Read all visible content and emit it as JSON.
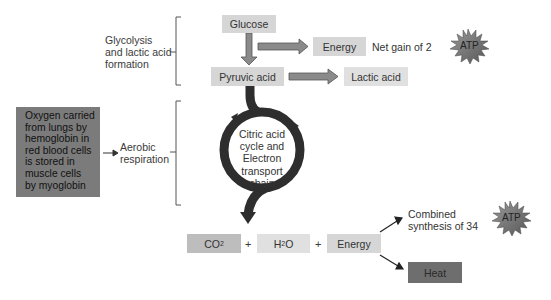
{
  "stages": {
    "glycolysis": {
      "label_lines": [
        "Glycolysis",
        "and lactic acid",
        "formation"
      ]
    },
    "aerobic": {
      "label_lines": [
        "Aerobic",
        "respiration"
      ]
    }
  },
  "boxes": {
    "glucose": "Glucose",
    "pyruvic_acid": "Pyruvic acid",
    "energy_top": "Energy",
    "lactic_acid": "Lactic acid",
    "co2": {
      "main": "CO",
      "sub": "2"
    },
    "h2o": {
      "main1": "H",
      "sub": "2",
      "main2": "O"
    },
    "energy_bottom": "Energy",
    "heat": "Heat"
  },
  "annotations": {
    "net_gain": "Net gain of 2",
    "combined_lines": [
      "Combined",
      "synthesis of 34"
    ],
    "plus": "+"
  },
  "atp": {
    "top": "ATP",
    "bottom": "ATP"
  },
  "oxygen_note": {
    "lines": [
      "Oxygen carried",
      "from lungs by",
      "hemoglobin in",
      "red blood cells",
      "is stored in",
      "muscle cells",
      "by myoglobin"
    ]
  },
  "cycle": {
    "lines": [
      "Citric acid",
      "cycle and",
      "Electron",
      "transport",
      "chain"
    ]
  },
  "colors": {
    "box_light": "#d6d6d6",
    "box_dark": "#6e6e6e",
    "oxygen_box": "#7b7b7b",
    "arrow_gray": "#8a8a8a",
    "cycle_dark": "#2e2e2e",
    "atp_star": "#7a7a7a"
  }
}
